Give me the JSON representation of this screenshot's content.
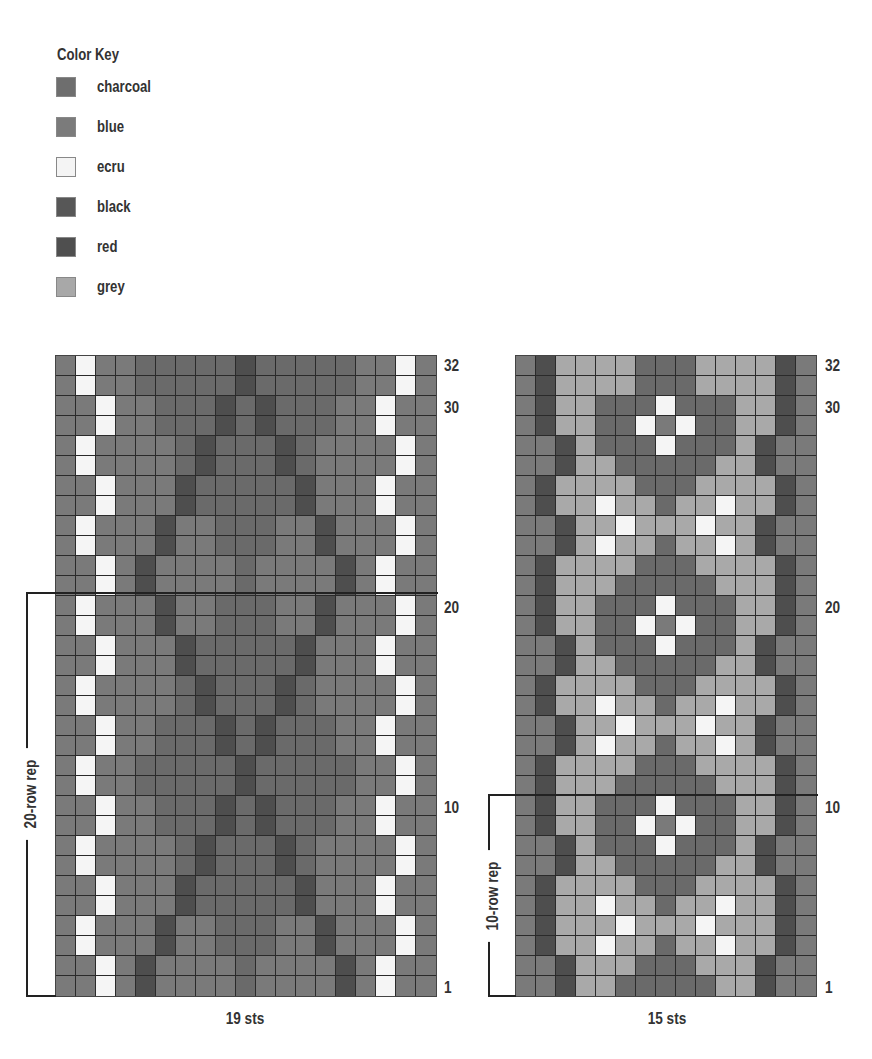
{
  "colorKey": {
    "title": "Color Key",
    "items": [
      {
        "code": "C",
        "label": "charcoal",
        "color": "#6e6e6e"
      },
      {
        "code": "B",
        "label": "blue",
        "color": "#7b7b7b"
      },
      {
        "code": "E",
        "label": "ecru",
        "color": "#f4f4f4"
      },
      {
        "code": "K",
        "label": "black",
        "color": "#575757"
      },
      {
        "code": "R",
        "label": "red",
        "color": "#4f4f4f"
      },
      {
        "code": "G",
        "label": "grey",
        "color": "#a8a8a8"
      }
    ]
  },
  "palette": {
    "C": "#7a7a7a",
    "B": "#6a6a6a",
    "E": "#f5f5f5",
    "K": "#555555",
    "R": "#4e4e4e",
    "G": "#a9a9a9"
  },
  "leftChart": {
    "stitches": 19,
    "rows": 32,
    "stsLabel": "19 sts",
    "repeatLabel": "20-row rep",
    "rowLabels": [
      "32",
      "30",
      "20",
      "10",
      "1"
    ],
    "rowsBottomUp": [
      "CCECRCCCCBCCCCRCECC",
      "CCECRCCCCBCCCCRCECC",
      "CECCCRCCBBBCCRCCCEC",
      "CECCCRCCBBBCCRCCCEC",
      "CCECCCRBBBBBRCCCECC",
      "CCECCCRBBBBBRCCCECC",
      "CECCCCBRBBBRBCCCCEC",
      "CECCCCBRBBBRBCCCCEC",
      "CCECCBBBRBRBBBCCECC",
      "CCECCBBBRBRBBBCCECC",
      "CECCBBBBBRBBBBBCCEC",
      "CECCBBBBBRBBBBBCCEC",
      "CCECCBBBRBRBBBCCECC",
      "CCECCBBBRBRBBBCCECC",
      "CECCCCBRBBBRBCCCCEC",
      "CECCCCBRBBBRBCCCCEC",
      "CCECCCRBBBBBRCCCECC",
      "CCECCCRBBBBBRCCCECC",
      "CECCCRCCBBBCCRCCCEC",
      "CECCCRCCBBBCCRCCCEC",
      "CCECRCCCCBCCCCRCECC",
      "CCECRCCCCBCCCCRCECC",
      "CECCCRCCBBBCCRCCCEC",
      "CECCCRCCBBBCCRCCCEC",
      "CCECCCRBBBBBRCCCECC",
      "CCECCCRBBBBBRCCCECC",
      "CECCCCBRBBBRBCCCCEC",
      "CECCCCBRBBBRBCCCCEC",
      "CCECCBBBRBRBBBCCECC",
      "CCECCBBBRBRBBBCCECC",
      "CECCBBBBBRBBBBBCCEC",
      "CECCBBBBBRBBBBBCCEC"
    ]
  },
  "rightChart": {
    "stitches": 15,
    "rows": 32,
    "stsLabel": "15 sts",
    "repeatLabel": "10-row rep",
    "rowLabels": [
      "32",
      "30",
      "20",
      "10",
      "1"
    ],
    "rowsBottomUp": [
      "CCRGGBBBBBGGRCC",
      "CCRGGGBBBGGGRCC",
      "CRGGEGGBGGEGGRC",
      "CRGGGEGGGEGGGRC",
      "CRGGEGGBGGEGGRC",
      "CRGGGGBBBGGGGRC",
      "CCRGGBBBBBGGRCC",
      "CCRGBBBEBBBGRCC",
      "CRGGBBECEBBGGRC",
      "CRGGBBBEBBBGGRC",
      "CRGGGBBBBBGGGRC",
      "CRGGGGBBBGGGGRC",
      "CCRGEGGBGGEGRCC",
      "CCRGGEGGGEGGRCC",
      "CRGGEGGBGGEGGRC",
      "CRGGGGBBBGGGGRC",
      "CCRGGBBBBBGGRCC",
      "CCRGBBBEBBBGRCC",
      "CRGGBBECEBBGGRC",
      "CRGGBBBEBBBGGRC",
      "CRGGGBBBBBGGGRC",
      "CRGGGGBBBGGGGRC",
      "CCRGEGGBGGEGRCC",
      "CCRGGEGGGEGGRCC",
      "CRGGEGGBGGEGGRC",
      "CRGGGGBBBGGGGRC",
      "CCRGGBBBBBGGRCC",
      "CCRGBBBEBBBGRCC",
      "CRGGBBECEBBGGRC",
      "CRGGBBBEBBBGGRC",
      "CRGGGGBBBGGGGRC",
      "CRGGGGBBBGGGGRC"
    ]
  }
}
